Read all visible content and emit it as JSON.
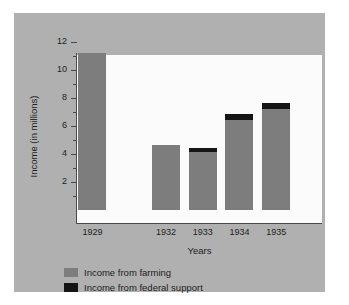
{
  "chart_data": {
    "type": "bar",
    "title": "",
    "subtitle": "",
    "xlabel": "Years",
    "ylabel": "Income (in millions)",
    "categories": [
      "1929",
      "1932",
      "1933",
      "1934",
      "1935"
    ],
    "series": [
      {
        "name": "Income from farming",
        "color": "#7d7d7d",
        "values": [
          11.2,
          4.65,
          4.15,
          6.4,
          7.2
        ]
      },
      {
        "name": "Income from federal support",
        "color": "#151515",
        "values": [
          0,
          0,
          0.25,
          0.45,
          0.45
        ]
      }
    ],
    "stacked": true,
    "totals": [
      11.2,
      4.65,
      4.4,
      6.85,
      7.65
    ],
    "ylim": [
      0,
      12
    ],
    "y_major_ticks": [
      2,
      4,
      6,
      8,
      10,
      12
    ],
    "y_minor_ticks": [
      1,
      3,
      5,
      7,
      9,
      11
    ],
    "y_tick_labels": [
      "2",
      "4",
      "6",
      "8",
      "10",
      "12"
    ],
    "grid": false,
    "legend_position": "below-left",
    "note_gap_years": "1930 and 1931 are omitted between 1929 and 1932",
    "category_positions_pct": [
      12,
      42,
      57,
      72,
      87
    ]
  },
  "legend": [
    {
      "label": "Income from farming",
      "color": "#7d7d7d"
    },
    {
      "label": "Income from federal support",
      "color": "#151515"
    }
  ],
  "colors": {
    "panel_background": "#b0b0b0",
    "plot_background": "#fbfbfb",
    "axis": "#4a4a4a",
    "text": "#1d1d1d",
    "farming": "#7d7d7d",
    "federal": "#151515"
  }
}
